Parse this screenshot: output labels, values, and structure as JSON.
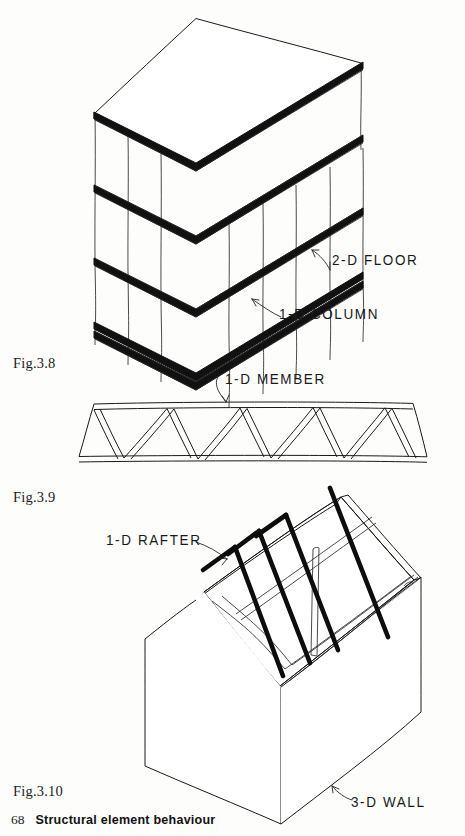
{
  "page": {
    "number": "68",
    "running_title": "Structural element behaviour",
    "background_color": "#fdfdfc",
    "ink_color": "#1a1a1a"
  },
  "figures": [
    {
      "id": "fig-3-8",
      "caption": "Fig.3.8",
      "subject": "isometric multi-storey frame",
      "annotations": [
        {
          "name": "floor-label",
          "text": "2-D FLOOR"
        },
        {
          "name": "column-label",
          "text": "1-D COLUMN"
        }
      ],
      "floors": 5,
      "columns": 6
    },
    {
      "id": "fig-3-9",
      "caption": "Fig.3.9",
      "subject": "warren truss elevation",
      "annotations": [
        {
          "name": "member-label",
          "text": "1-D MEMBER"
        }
      ],
      "panels": 5
    },
    {
      "id": "fig-3-10",
      "caption": "Fig.3.10",
      "subject": "house with pitched roof rafters",
      "annotations": [
        {
          "name": "rafter-label",
          "text": "1-D RAFTER"
        },
        {
          "name": "wall-label",
          "text": "3-D WALL"
        }
      ],
      "rafters": 4
    }
  ],
  "captions": {
    "fig_3_8": "Fig.3.8",
    "fig_3_9": "Fig.3.9",
    "fig_3_10": "Fig.3.10"
  },
  "labels": {
    "floor": "2-D FLOOR",
    "column": "1-D COLUMN",
    "member": "1-D MEMBER",
    "rafter": "1-D RAFTER",
    "wall": "3-D WALL"
  },
  "footer": {
    "page_number": "68",
    "title": "Structural element behaviour"
  }
}
